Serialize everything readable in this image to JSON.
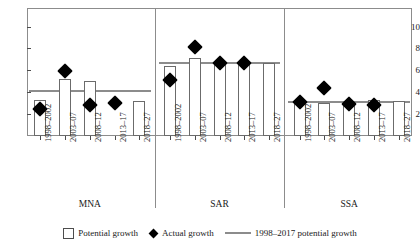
{
  "axis": {
    "y_ticks": [
      2,
      4,
      6,
      8,
      10
    ],
    "y_min": 0,
    "y_max": 11.6
  },
  "legend": {
    "potential": "Potential growth",
    "actual": "Actual growth",
    "reference": "1998–2017 potential growth",
    "icons": {
      "potential": "white-square-icon",
      "actual": "black-diamond-icon",
      "reference": "gray-line-icon"
    }
  },
  "colors": {
    "bar_fill": "#ffffff",
    "bar_edge": "#6b6b6b",
    "marker": "#000000",
    "reference_line": "#8c8c8c",
    "frame": "#8c8c8c",
    "text": "#1a1a1a"
  },
  "groups": [
    {
      "name": "MNA",
      "periods": [
        "1998–2002",
        "2003–07",
        "2008–12",
        "2013–17",
        "2018–27"
      ],
      "potential_growth": [
        3.3,
        5.2,
        5.0,
        null,
        3.2
      ],
      "actual_growth": [
        2.5,
        5.9,
        2.8,
        3.0,
        null
      ],
      "reference_line": 4.15
    },
    {
      "name": "SAR",
      "periods": [
        "1998–2002",
        "2003–07",
        "2008–12",
        "2013–17",
        "2018–27"
      ],
      "potential_growth": [
        6.4,
        7.1,
        6.7,
        6.7,
        6.7
      ],
      "actual_growth": [
        5.1,
        8.1,
        6.7,
        6.7,
        null
      ],
      "reference_line": 6.7
    },
    {
      "name": "SSA",
      "periods": [
        "1998–2002",
        "2003–07",
        "2008–12",
        "2013–17",
        "2018–27"
      ],
      "potential_growth": [
        3.0,
        3.0,
        3.1,
        3.3,
        3.2
      ],
      "actual_growth": [
        3.1,
        4.4,
        2.9,
        2.8,
        null
      ],
      "reference_line": 3.1
    }
  ],
  "chart_data": {
    "type": "bar",
    "title": "",
    "subtitle": "",
    "xlabel": "",
    "ylabel": "",
    "ylim": [
      0,
      11.6
    ],
    "yticks": [
      2,
      4,
      6,
      8,
      10
    ],
    "grid": false,
    "legend_position": "bottom",
    "categories": [
      "MNA 1998–2002",
      "MNA 2003–07",
      "MNA 2008–12",
      "MNA 2013–17",
      "MNA 2018–27",
      "SAR 1998–2002",
      "SAR 2003–07",
      "SAR 2008–12",
      "SAR 2013–17",
      "SAR 2018–27",
      "SSA 1998–2002",
      "SSA 2003–07",
      "SSA 2008–12",
      "SSA 2013–17",
      "SSA 2018–27"
    ],
    "series": [
      {
        "name": "Potential growth",
        "type": "bar",
        "values": [
          3.3,
          5.2,
          5.0,
          null,
          3.2,
          6.4,
          7.1,
          6.7,
          6.7,
          6.7,
          3.0,
          3.0,
          3.1,
          3.3,
          3.2
        ]
      },
      {
        "name": "Actual growth",
        "type": "scatter",
        "values": [
          2.5,
          5.9,
          2.8,
          3.0,
          null,
          5.1,
          8.1,
          6.7,
          6.7,
          null,
          3.1,
          4.4,
          2.9,
          2.8,
          null
        ]
      },
      {
        "name": "1998–2017 potential growth",
        "type": "line",
        "values": [
          4.15,
          4.15,
          4.15,
          4.15,
          4.15,
          6.7,
          6.7,
          6.7,
          6.7,
          6.7,
          3.1,
          3.1,
          3.1,
          3.1,
          3.1
        ]
      }
    ],
    "group_labels": [
      "MNA",
      "SAR",
      "SSA"
    ],
    "period_labels": [
      "1998–2002",
      "2003–07",
      "2008–12",
      "2013–17",
      "2018–27"
    ]
  }
}
